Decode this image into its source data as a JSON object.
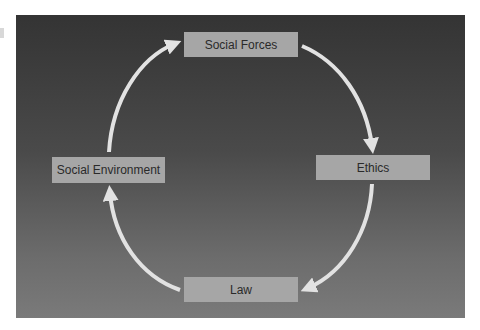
{
  "diagram": {
    "type": "cycle",
    "nodes": [
      {
        "id": "social_forces",
        "label": "Social Forces"
      },
      {
        "id": "ethics",
        "label": "Ethics"
      },
      {
        "id": "law",
        "label": "Law"
      },
      {
        "id": "social_environment",
        "label": "Social Environment"
      }
    ],
    "edges": [
      {
        "from": "social_forces",
        "to": "ethics"
      },
      {
        "from": "ethics",
        "to": "law"
      },
      {
        "from": "law",
        "to": "social_environment"
      },
      {
        "from": "social_environment",
        "to": "social_forces"
      }
    ],
    "colors": {
      "panel_top": "#343434",
      "panel_bottom": "#7a7a7a",
      "node_fill": "#a6a6a6",
      "node_text": "#2a2a2a",
      "arrow": "#e2e2e2"
    }
  }
}
